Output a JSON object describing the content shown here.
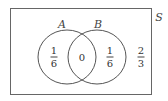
{
  "diagram": {
    "type": "venn",
    "universe_label": "S",
    "sets": [
      {
        "label": "A"
      },
      {
        "label": "B"
      }
    ],
    "regions": {
      "a_only": {
        "numerator": "1",
        "denominator": "6"
      },
      "intersection": {
        "value": "0"
      },
      "b_only": {
        "numerator": "1",
        "denominator": "6"
      },
      "outside": {
        "numerator": "2",
        "denominator": "3"
      }
    },
    "colors": {
      "stroke": "#555555",
      "background": "#ffffff"
    }
  }
}
